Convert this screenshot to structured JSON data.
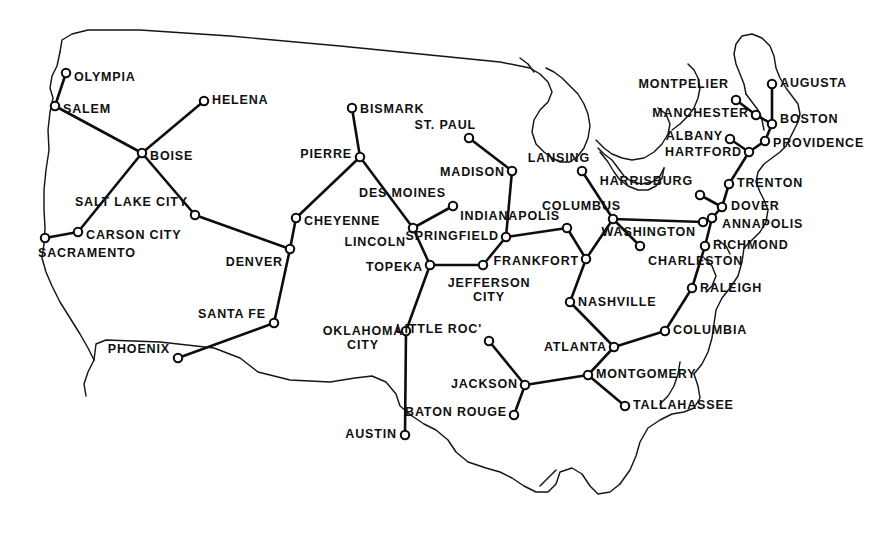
{
  "map": {
    "title": "United States State Capitals Network",
    "width": 873,
    "height": 540,
    "background_color": "#ffffff",
    "line_color": "#0d0d0d",
    "node_fill_color": "#ffffff",
    "coastline_color": "#151515"
  },
  "cities": [
    {
      "id": "olympia",
      "label": "OLYMPIA",
      "x": 66,
      "y": 73,
      "lx": 74,
      "ly": 78,
      "anchor": "start"
    },
    {
      "id": "salem",
      "label": "SALEM",
      "x": 55,
      "y": 106,
      "lx": 63,
      "ly": 110,
      "anchor": "start"
    },
    {
      "id": "helena",
      "label": "HELENA",
      "x": 204,
      "y": 101,
      "lx": 212,
      "ly": 101,
      "anchor": "start"
    },
    {
      "id": "boise",
      "label": "BOISE",
      "x": 142,
      "y": 153,
      "lx": 150,
      "ly": 157,
      "anchor": "start"
    },
    {
      "id": "salt-lake-city",
      "label": "SALT LAKE CITY",
      "x": 195,
      "y": 215,
      "lx": 188,
      "ly": 203,
      "anchor": "end"
    },
    {
      "id": "carson-city",
      "label": "CARSON CITY",
      "x": 78,
      "y": 232,
      "lx": 86,
      "ly": 236,
      "anchor": "start"
    },
    {
      "id": "sacramento",
      "label": "SACRAMENTO",
      "x": 45,
      "y": 238,
      "lx": 38,
      "ly": 254,
      "anchor": "start"
    },
    {
      "id": "denver",
      "label": "DENVER",
      "x": 290,
      "y": 249,
      "lx": 283,
      "ly": 263,
      "anchor": "end"
    },
    {
      "id": "cheyenne",
      "label": "CHEYENNE",
      "x": 296,
      "y": 218,
      "lx": 304,
      "ly": 222,
      "anchor": "start"
    },
    {
      "id": "santa-fe",
      "label": "SANTA FE",
      "x": 274,
      "y": 323,
      "lx": 266,
      "ly": 315,
      "anchor": "end"
    },
    {
      "id": "phoenix",
      "label": "PHOENIX",
      "x": 178,
      "y": 358,
      "lx": 170,
      "ly": 350,
      "anchor": "end"
    },
    {
      "id": "bismark",
      "label": "BISMARK",
      "x": 352,
      "y": 108,
      "lx": 360,
      "ly": 110,
      "anchor": "start"
    },
    {
      "id": "pierre",
      "label": "PIERRE",
      "x": 360,
      "y": 157,
      "lx": 352,
      "ly": 155,
      "anchor": "end"
    },
    {
      "id": "lincoln",
      "label": "LINCOLN",
      "x": 413,
      "y": 228,
      "lx": 406,
      "ly": 243,
      "anchor": "end"
    },
    {
      "id": "des-moines",
      "label": "DES MOINES",
      "x": 453,
      "y": 206,
      "lx": 446,
      "ly": 194,
      "anchor": "end"
    },
    {
      "id": "topeka",
      "label": "TOPEKA",
      "x": 430,
      "y": 265,
      "lx": 423,
      "ly": 268,
      "anchor": "end"
    },
    {
      "id": "st-paul",
      "label": "ST. PAUL",
      "x": 469,
      "y": 138,
      "lx": 476,
      "ly": 126,
      "anchor": "end"
    },
    {
      "id": "madison",
      "label": "MADISON",
      "x": 512,
      "y": 171,
      "lx": 505,
      "ly": 173,
      "anchor": "end"
    },
    {
      "id": "springfield",
      "label": "SPRINGFIELD",
      "x": 506,
      "y": 237,
      "lx": 499,
      "ly": 237,
      "anchor": "end"
    },
    {
      "id": "jefferson-city",
      "label": "JEFFERSON\nCITY",
      "x": 483,
      "y": 265,
      "lx": 489,
      "ly": 290,
      "anchor": "mid"
    },
    {
      "id": "lansing",
      "label": "LANSING",
      "x": 582,
      "y": 171,
      "lx": 590,
      "ly": 159,
      "anchor": "end"
    },
    {
      "id": "indianapolis",
      "label": "INDIANAPOLIS",
      "x": 567,
      "y": 228,
      "lx": 560,
      "ly": 217,
      "anchor": "end"
    },
    {
      "id": "frankfort",
      "label": "FRANKFORT",
      "x": 586,
      "y": 259,
      "lx": 579,
      "ly": 262,
      "anchor": "end"
    },
    {
      "id": "columbus",
      "label": "COLUMBUS",
      "x": 613,
      "y": 219,
      "lx": 621,
      "ly": 207,
      "anchor": "end"
    },
    {
      "id": "charleston",
      "label": "CHARLESTON",
      "x": 640,
      "y": 246,
      "lx": 648,
      "ly": 262,
      "anchor": "start"
    },
    {
      "id": "nashville",
      "label": "NASHVILLE",
      "x": 570,
      "y": 302,
      "lx": 578,
      "ly": 303,
      "anchor": "start"
    },
    {
      "id": "atlanta",
      "label": "ATLANTA",
      "x": 614,
      "y": 347,
      "lx": 607,
      "ly": 348,
      "anchor": "end"
    },
    {
      "id": "columbia",
      "label": "COLUMBIA",
      "x": 665,
      "y": 331,
      "lx": 673,
      "ly": 331,
      "anchor": "start"
    },
    {
      "id": "raleigh",
      "label": "RALEIGH",
      "x": 692,
      "y": 288,
      "lx": 700,
      "ly": 289,
      "anchor": "start"
    },
    {
      "id": "richmond",
      "label": "RICHMOND",
      "x": 705,
      "y": 246,
      "lx": 713,
      "ly": 246,
      "anchor": "start"
    },
    {
      "id": "montgomery",
      "label": "MONTGOMERY",
      "x": 588,
      "y": 375,
      "lx": 596,
      "ly": 375,
      "anchor": "start"
    },
    {
      "id": "tallahassee",
      "label": "TALLAHASSEE",
      "x": 625,
      "y": 406,
      "lx": 633,
      "ly": 406,
      "anchor": "start"
    },
    {
      "id": "jackson",
      "label": "JACKSON",
      "x": 525,
      "y": 385,
      "lx": 518,
      "ly": 385,
      "anchor": "end"
    },
    {
      "id": "baton-rouge",
      "label": "BATON ROUGE",
      "x": 514,
      "y": 415,
      "lx": 507,
      "ly": 413,
      "anchor": "end"
    },
    {
      "id": "little-rock",
      "label": "LITTLE ROC'",
      "x": 489,
      "y": 341,
      "lx": 482,
      "ly": 330,
      "anchor": "end"
    },
    {
      "id": "oklahoma-city",
      "label": "OKLAHOMA\nCITY",
      "x": 406,
      "y": 331,
      "lx": 363,
      "ly": 338,
      "anchor": "mid"
    },
    {
      "id": "austin",
      "label": "AUSTIN",
      "x": 405,
      "y": 435,
      "lx": 397,
      "ly": 435,
      "anchor": "end"
    },
    {
      "id": "washington",
      "label": "WASHINGTON",
      "x": 703,
      "y": 222,
      "lx": 696,
      "ly": 233,
      "anchor": "end"
    },
    {
      "id": "annapolis",
      "label": "ANNAPOLIS",
      "x": 712,
      "y": 218,
      "lx": 722,
      "ly": 225,
      "anchor": "start"
    },
    {
      "id": "dover",
      "label": "DOVER",
      "x": 722,
      "y": 207,
      "lx": 731,
      "ly": 207,
      "anchor": "start"
    },
    {
      "id": "trenton",
      "label": "TRENTON",
      "x": 729,
      "y": 184,
      "lx": 737,
      "ly": 184,
      "anchor": "start"
    },
    {
      "id": "harrisburg",
      "label": "HARRISBURG",
      "x": 700,
      "y": 195,
      "lx": 693,
      "ly": 182,
      "anchor": "end"
    },
    {
      "id": "hartford",
      "label": "HARTFORD",
      "x": 749,
      "y": 152,
      "lx": 742,
      "ly": 153,
      "anchor": "end"
    },
    {
      "id": "albany",
      "label": "ALBANY",
      "x": 730,
      "y": 139,
      "lx": 723,
      "ly": 137,
      "anchor": "end"
    },
    {
      "id": "providence",
      "label": "PROVIDENCE",
      "x": 765,
      "y": 141,
      "lx": 773,
      "ly": 144,
      "anchor": "start"
    },
    {
      "id": "boston",
      "label": "BOSTON",
      "x": 772,
      "y": 124,
      "lx": 780,
      "ly": 120,
      "anchor": "start"
    },
    {
      "id": "manchester",
      "label": "MANCHESTER",
      "x": 756,
      "y": 115,
      "lx": 749,
      "ly": 114,
      "anchor": "end"
    },
    {
      "id": "montpelier",
      "label": "MONTPELIER",
      "x": 736,
      "y": 100,
      "lx": 729,
      "ly": 85,
      "anchor": "end"
    },
    {
      "id": "augusta",
      "label": "AUGUSTA",
      "x": 772,
      "y": 84,
      "lx": 780,
      "ly": 84,
      "anchor": "start"
    }
  ],
  "edges": [
    [
      "olympia",
      "salem"
    ],
    [
      "salem",
      "boise"
    ],
    [
      "boise",
      "helena"
    ],
    [
      "boise",
      "salt-lake-city"
    ],
    [
      "boise",
      "carson-city"
    ],
    [
      "carson-city",
      "sacramento"
    ],
    [
      "salt-lake-city",
      "denver"
    ],
    [
      "denver",
      "cheyenne"
    ],
    [
      "denver",
      "santa-fe"
    ],
    [
      "santa-fe",
      "phoenix"
    ],
    [
      "cheyenne",
      "pierre"
    ],
    [
      "pierre",
      "bismark"
    ],
    [
      "pierre",
      "lincoln"
    ],
    [
      "lincoln",
      "des-moines"
    ],
    [
      "lincoln",
      "topeka"
    ],
    [
      "topeka",
      "jefferson-city"
    ],
    [
      "topeka",
      "oklahoma-city"
    ],
    [
      "oklahoma-city",
      "austin"
    ],
    [
      "jefferson-city",
      "springfield"
    ],
    [
      "springfield",
      "madison"
    ],
    [
      "madison",
      "st-paul"
    ],
    [
      "springfield",
      "indianapolis"
    ],
    [
      "indianapolis",
      "frankfort"
    ],
    [
      "frankfort",
      "nashville"
    ],
    [
      "frankfort",
      "columbus"
    ],
    [
      "columbus",
      "lansing"
    ],
    [
      "columbus",
      "charleston"
    ],
    [
      "columbus",
      "washington"
    ],
    [
      "nashville",
      "atlanta"
    ],
    [
      "atlanta",
      "columbia"
    ],
    [
      "atlanta",
      "montgomery"
    ],
    [
      "montgomery",
      "jackson"
    ],
    [
      "montgomery",
      "tallahassee"
    ],
    [
      "jackson",
      "little-rock"
    ],
    [
      "jackson",
      "baton-rouge"
    ],
    [
      "columbia",
      "raleigh"
    ],
    [
      "raleigh",
      "richmond"
    ],
    [
      "richmond",
      "annapolis"
    ],
    [
      "washington",
      "annapolis"
    ],
    [
      "annapolis",
      "dover"
    ],
    [
      "dover",
      "harrisburg"
    ],
    [
      "dover",
      "trenton"
    ],
    [
      "trenton",
      "hartford"
    ],
    [
      "hartford",
      "albany"
    ],
    [
      "hartford",
      "providence"
    ],
    [
      "providence",
      "boston"
    ],
    [
      "boston",
      "manchester"
    ],
    [
      "boston",
      "augusta"
    ],
    [
      "manchester",
      "montpelier"
    ]
  ],
  "coastline_paths": [
    "M 60 52 L 62 40 L 72 34 L 88 30 L 140 30 L 230 36 L 340 46 L 430 55 L 500 62 L 530 68",
    "M 60 52 L 57 66 L 52 76 L 50 88 L 53 98 L 50 112 L 48 130 L 49 150 L 46 170 L 44 190 L 44 210 L 45 228 L 44 244 L 42 258 L 46 272 L 52 286 L 60 302 L 70 318 L 80 334 L 88 348 L 94 360",
    "M 94 360 L 96 344 L 106 340 L 160 342 L 214 348 L 240 358 L 258 372 L 290 380 L 330 382 L 355 378 L 372 376 L 386 382 L 396 394 L 400 406 L 412 416 L 424 424 L 436 430 L 448 440 L 456 452 L 468 462 L 486 468 L 500 472 L 512 478 L 524 486 L 536 492 L 548 492 L 556 484 L 560 472 L 572 468 L 582 474 L 590 486 L 598 494 L 610 492 L 620 484",
    "M 94 360 L 88 372 L 84 384 L 86 396",
    "M 620 484 L 630 470 L 636 456 L 640 442 L 648 428 L 660 420 L 672 414 L 684 412 L 694 408 L 700 398 L 698 386 L 694 374",
    "M 694 374 L 702 364 L 708 352 L 712 338 L 714 324 L 716 310 L 722 298 L 730 288 L 738 276 L 742 262 L 744 248",
    "M 744 248 L 752 240 L 760 232 L 766 222 L 768 210 L 764 200 L 760 192 L 756 182 L 758 172 L 764 164 L 772 158 L 780 152 L 786 146 L 790 138 L 794 130 L 798 122 L 800 114 L 798 104 L 792 96 L 786 88 L 780 78 L 776 68 L 774 56 L 770 46 L 762 38 L 752 34 L 742 36 L 736 44 L 734 54 L 736 64 L 740 74 L 744 84 L 746 94",
    "M 530 68 L 540 74 L 548 82 L 552 92 L 548 102 L 540 110 L 534 120 L 532 132 L 536 144 L 544 152 L 552 158 L 560 162 L 570 162 L 578 156 L 584 148 L 588 138 L 590 126 L 588 114 L 584 104 L 578 94 L 570 86 L 562 78 L 554 72 L 546 68",
    "M 596 140 L 604 148 L 612 154 L 622 158 L 632 160 L 644 158 L 654 152 L 662 144 L 668 134 L 670 124 L 666 114 L 658 108",
    "M 600 152 L 608 162 L 614 172 L 620 180 L 628 186 L 638 190 L 648 190 L 656 186 L 662 178 L 664 168",
    "M 664 168 L 660 176 L 652 182 L 642 184 L 632 182 L 624 176 L 618 168 L 612 160 L 604 154 L 598 148",
    "M 672 130 L 680 124 L 688 116 L 694 108 L 698 98 L 700 88 L 698 78 L 694 70 L 688 64",
    "M 520 58 L 528 64 L 534 72",
    "M 746 94 L 752 102 L 758 110 L 762 120 L 764 130",
    "M 704 258 L 712 266 L 716 276 L 712 286 L 706 292",
    "M 718 240 L 726 246 L 730 254",
    "M 660 404 L 668 396 L 674 386 L 678 374 L 680 362",
    "M 540 486 L 548 478 L 556 470"
  ]
}
